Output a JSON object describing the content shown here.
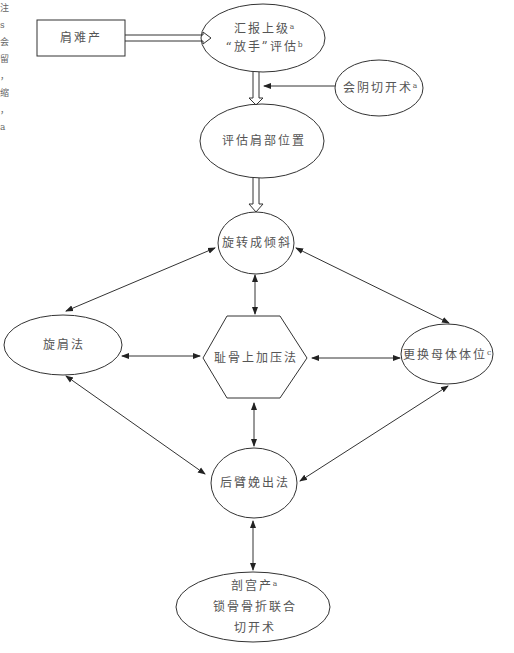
{
  "diagram": {
    "type": "flowchart",
    "nodes": {
      "shoulder_dystocia": {
        "label": "肩难产",
        "shape": "rectangle"
      },
      "report": {
        "lines": [
          "汇报上级ᵃ",
          "“放手”评估ᵇ"
        ],
        "shape": "ellipse"
      },
      "episiotomy": {
        "label": "会阴切开术ᵃ",
        "shape": "ellipse"
      },
      "assess_position": {
        "label": "评估肩部位置",
        "shape": "ellipse"
      },
      "rotate_oblique": {
        "label": "旋转成倾斜",
        "shape": "ellipse"
      },
      "rotate_shoulder": {
        "label": "旋肩法",
        "shape": "ellipse"
      },
      "suprapubic": {
        "label": "耻骨上加压法",
        "shape": "hexagon"
      },
      "change_position": {
        "label": "更换母体体位ᶜ",
        "shape": "ellipse"
      },
      "posterior_arm": {
        "label": "后臂娩出法",
        "shape": "ellipse"
      },
      "cesarean": {
        "lines": [
          "剖宫产ᵃ",
          "锁骨骨折联合",
          "切开术"
        ],
        "shape": "ellipse"
      }
    },
    "edges": [
      {
        "from": "肩难产",
        "to": "汇报上级",
        "style": "hollow-arrow"
      },
      {
        "from": "汇报上级",
        "to": "评估肩部位置",
        "style": "hollow-arrow"
      },
      {
        "from": "会阴切开术",
        "to": "hollow-arrow-shaft",
        "style": "arrow"
      },
      {
        "from": "评估肩部位置",
        "to": "旋转成倾斜",
        "style": "hollow-arrow"
      },
      {
        "from": "旋转成倾斜",
        "to": "旋肩法",
        "style": "double-arrow"
      },
      {
        "from": "旋转成倾斜",
        "to": "耻骨上加压法",
        "style": "double-arrow"
      },
      {
        "from": "旋转成倾斜",
        "to": "更换母体体位",
        "style": "double-arrow"
      },
      {
        "from": "旋肩法",
        "to": "耻骨上加压法",
        "style": "double-arrow"
      },
      {
        "from": "耻骨上加压法",
        "to": "更换母体体位",
        "style": "double-arrow"
      },
      {
        "from": "旋肩法",
        "to": "后臂娩出法",
        "style": "double-arrow"
      },
      {
        "from": "耻骨上加压法",
        "to": "后臂娩出法",
        "style": "double-arrow"
      },
      {
        "from": "更换母体体位",
        "to": "后臂娩出法",
        "style": "double-arrow"
      },
      {
        "from": "后臂娩出法",
        "to": "剖宫产",
        "style": "double-arrow"
      }
    ]
  },
  "margin_text": [
    "注",
    "s",
    "会",
    "留",
    "，",
    "缩",
    "，",
    "a"
  ]
}
